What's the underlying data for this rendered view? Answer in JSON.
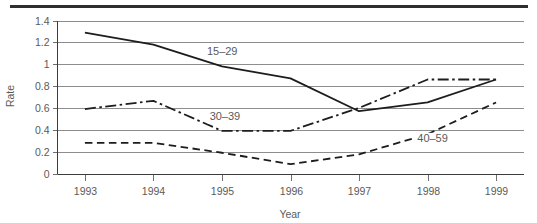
{
  "figure": {
    "name": "rate-by-year-line-chart",
    "top_rule": true
  },
  "chart_data": {
    "type": "line",
    "title": "",
    "subtitle": "",
    "xlabel": "Year",
    "ylabel": "Rate",
    "categories": [
      "1993",
      "1994",
      "1995",
      "1996",
      "1997",
      "1998",
      "1999"
    ],
    "x": [
      1993,
      1994,
      1995,
      1996,
      1997,
      1998,
      1999
    ],
    "xlim": [
      1992.6,
      1999.4
    ],
    "ylim": [
      0,
      1.4
    ],
    "yticks": [
      0,
      0.2,
      0.4,
      0.6,
      0.8,
      1,
      1.2,
      1.4
    ],
    "ytick_labels": [
      "0",
      "0.2",
      "0.4",
      "0.6",
      "0.8",
      "1",
      "1.2",
      "1.4"
    ],
    "xtick_labels": [
      "1993",
      "1994",
      "1995",
      "1996",
      "1997",
      "1998",
      "1999"
    ],
    "grid": "horizontal",
    "legend": "inline-labels",
    "legend_position": "on-plot",
    "series": [
      {
        "name": "15-29",
        "label": "15–29",
        "style": "solid",
        "dasharray": "none",
        "color": "#1d1d1d",
        "values": [
          1.29,
          1.18,
          0.98,
          0.87,
          0.57,
          0.65,
          0.86
        ],
        "label_x": 1994.78,
        "label_y": 1.08
      },
      {
        "name": "30-39",
        "label": "30–39",
        "style": "dash-dot",
        "dasharray": "11,3.5,2.5,3.5",
        "color": "#1d1d1d",
        "values": [
          0.59,
          0.665,
          0.39,
          0.39,
          0.6,
          0.86,
          0.86
        ],
        "label_x": 1994.82,
        "label_y": 0.485
      },
      {
        "name": "40-59",
        "label": "40–59",
        "style": "dashed",
        "dasharray": "7.5,4.5",
        "color": "#1d1d1d",
        "values": [
          0.28,
          0.28,
          0.19,
          0.085,
          0.175,
          0.36,
          0.65
        ],
        "label_x": 1997.85,
        "label_y": 0.285
      }
    ],
    "annotations": [
      {
        "text": "15–29",
        "series": "15-29"
      },
      {
        "text": "30–39",
        "series": "30-39"
      },
      {
        "text": "40–59",
        "series": "40-59"
      }
    ]
  }
}
